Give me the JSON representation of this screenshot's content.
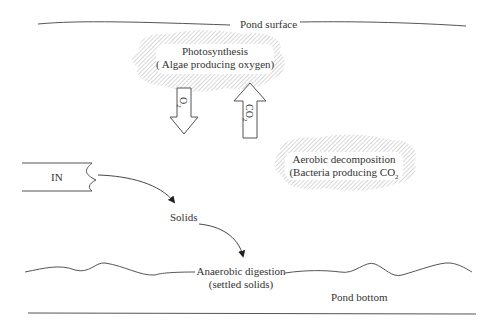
{
  "diagram": {
    "surface_label": "Pond surface",
    "photosynthesis": {
      "title": "Photosynthesis",
      "subtitle": "( Algae producing oxygen)"
    },
    "o2_arrow": {
      "label": "O",
      "sub": "2",
      "direction": "down"
    },
    "co2_arrow": {
      "label": "CO",
      "sub": "2",
      "direction": "up"
    },
    "aerobic": {
      "title": "Aerobic decomposition",
      "subtitle_main": "(Bacteria producing CO",
      "subtitle_sub": "2"
    },
    "inlet_label": "IN",
    "solids_label": "Solids",
    "anaerobic": {
      "title": "Anaerobic digestion",
      "subtitle": "(settled solids)"
    },
    "bottom_label": "Pond bottom"
  }
}
